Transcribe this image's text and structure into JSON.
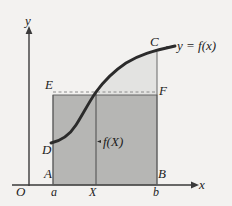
{
  "figure": {
    "axes": {
      "y_label": "y",
      "x_label": "x",
      "origin_label": "O"
    },
    "point_labels": {
      "A": "A",
      "B": "B",
      "C": "C",
      "D": "D",
      "E": "E",
      "F": "F"
    },
    "tick_labels": {
      "a": "a",
      "X": "X",
      "b": "b"
    },
    "annotations": {
      "curve_equation": "y = f(x)",
      "ordinate": "f(X)"
    },
    "colors": {
      "background": "#f3f2f0",
      "dark_fill": "#b6b6b4",
      "light_fill": "#e3e3e1",
      "curve": "#2b2b2b",
      "axis": "#3a3a3a",
      "thin_line": "#555555",
      "dash_line": "#8a8a8a"
    },
    "geometry": {
      "x_axis_y": 185,
      "y_axis_x": 29,
      "a_x": 53,
      "X_x": 96,
      "b_x": 157,
      "EF_y": 95,
      "C_y": 52,
      "D_y": 142
    }
  }
}
